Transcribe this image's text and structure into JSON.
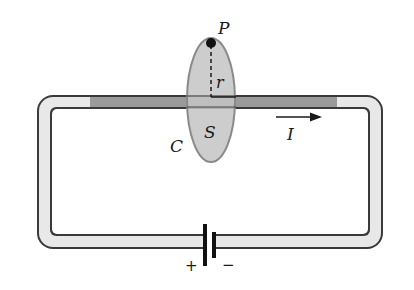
{
  "diagram": {
    "labels": {
      "point": "P",
      "radius": "r",
      "surface": "S",
      "curve": "C",
      "current": "I",
      "battery_plus": "+",
      "battery_minus": "−"
    },
    "colors": {
      "wire_fill": "#e6e6e6",
      "wire_outline": "#3a3a3a",
      "wire_highlight": "#9a9a9a",
      "surface_fill": "#c8c8c8",
      "surface_outline": "#8a8a8a",
      "ink": "#1a1a1a"
    }
  }
}
